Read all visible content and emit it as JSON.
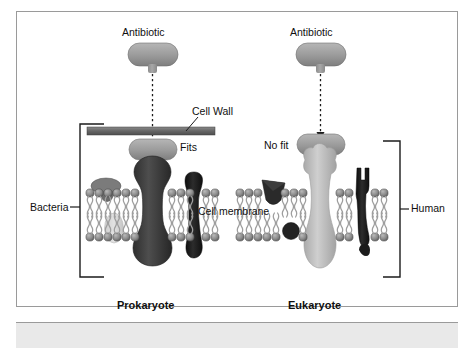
{
  "figure": {
    "type": "biology-diagram",
    "panels": [
      {
        "id": "prokaryote",
        "caption": "Prokaryote",
        "side_label": "Bacteria",
        "drug_label": "Antibiotic",
        "fit_label": "Fits",
        "has_cell_wall": true,
        "cell_wall_label": "Cell Wall"
      },
      {
        "id": "eukaryote",
        "caption": "Eukaryote",
        "side_label": "Human",
        "drug_label": "Antibiotic",
        "fit_label": "No fit",
        "has_cell_wall": false
      }
    ],
    "shared_labels": {
      "membrane": "Cell membrane"
    }
  },
  "labels": {
    "antibiotic_left": "Antibiotic",
    "antibiotic_right": "Antibiotic",
    "cell_wall": "Cell Wall",
    "fits": "Fits",
    "no_fit": "No fit",
    "bacteria": "Bacteria",
    "human": "Human",
    "cell_membrane": "Cell membrane",
    "prokaryote": "Prokaryote",
    "eukaryote": "Eukaryote"
  },
  "colors": {
    "frame_border": "#9a9a9a",
    "page_background": "#ffffff",
    "bottom_band": "#e9e9e9",
    "text": "#101010",
    "cell_wall": "#6d6d6d",
    "antibiotic_fill": "#9b9b9b",
    "prokaryote_receptor": "#3f3f3f",
    "eukaryote_receptor": "#b9b9b9",
    "dark_protein": "#1b1b1b",
    "membrane_head": "#8a8a8a",
    "membrane_tail": "#b5b5b5",
    "bracket": "#1b1b1b"
  }
}
